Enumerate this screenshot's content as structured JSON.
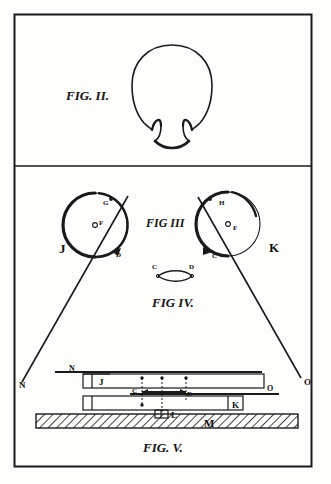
{
  "sheet": {
    "title": "Patent drawing sheet",
    "background_color": "#fdfdfb",
    "ink_color": "#1a1a1a",
    "border": {
      "x": 14,
      "y": 14,
      "width": 298,
      "height": 453,
      "divider_y": 166
    }
  },
  "figures": [
    {
      "id": "fig2",
      "caption": "FIG. II.",
      "caption_x": 66,
      "caption_y": 100,
      "description": "head outline top view with band",
      "labels": []
    },
    {
      "id": "fig3",
      "caption": "FIG III",
      "caption_x": 146,
      "caption_y": 227,
      "description": "two circular lens mounts with diagonal sight lines",
      "labels": [
        {
          "text": "G",
          "x": 103,
          "y": 205
        },
        {
          "text": "F",
          "x": 99,
          "y": 225
        },
        {
          "text": "D",
          "x": 116,
          "y": 257
        },
        {
          "text": "J",
          "x": 59,
          "y": 253
        },
        {
          "text": "H",
          "x": 219,
          "y": 205
        },
        {
          "text": "F",
          "x": 233,
          "y": 230
        },
        {
          "text": "C",
          "x": 212,
          "y": 258
        },
        {
          "text": "K",
          "x": 269,
          "y": 252
        },
        {
          "text": "N",
          "x": 19,
          "y": 388
        },
        {
          "text": "O",
          "x": 304,
          "y": 385
        }
      ]
    },
    {
      "id": "fig4",
      "caption": "FIG IV.",
      "caption_x": 152,
      "caption_y": 307,
      "description": "lens cross section with endpoints C and D",
      "labels": [
        {
          "text": "C",
          "x": 153,
          "y": 269
        },
        {
          "text": "D",
          "x": 189,
          "y": 269
        }
      ]
    },
    {
      "id": "fig5",
      "caption": "FIG. V.",
      "caption_x": 143,
      "caption_y": 452,
      "description": "side elevation of adjusting apparatus on hatched base",
      "labels": [
        {
          "text": "N",
          "x": 69,
          "y": 371
        },
        {
          "text": "J",
          "x": 99,
          "y": 381
        },
        {
          "text": "C",
          "x": 134,
          "y": 394
        },
        {
          "text": "D",
          "x": 187,
          "y": 396
        },
        {
          "text": "O",
          "x": 267,
          "y": 388
        },
        {
          "text": "K",
          "x": 233,
          "y": 401
        },
        {
          "text": "L",
          "x": 170,
          "y": 412
        },
        {
          "text": "M",
          "x": 209,
          "y": 427
        }
      ]
    }
  ],
  "fig2_geometry": {
    "head_cx": 172,
    "head_cy": 93,
    "head_rx": 40,
    "head_ry": 48
  },
  "fig3_geometry": {
    "left_circle": {
      "cx": 95,
      "cy": 225,
      "r": 32
    },
    "right_circle": {
      "cx": 228,
      "cy": 224,
      "r": 32
    },
    "left_line": {
      "x1": 128,
      "y1": 197,
      "x2": 22,
      "y2": 382
    },
    "right_line": {
      "x1": 198,
      "y1": 198,
      "x2": 300,
      "y2": 379
    }
  },
  "fig5_geometry": {
    "top_rod_y": 372,
    "upper_bar": {
      "x": 83,
      "y": 374,
      "width": 181,
      "height": 14
    },
    "mid_rod_y": 394,
    "lower_bar": {
      "x": 83,
      "y": 396,
      "width": 160,
      "height": 14
    },
    "base": {
      "x": 36,
      "y": 414,
      "width": 262,
      "height": 14
    }
  }
}
